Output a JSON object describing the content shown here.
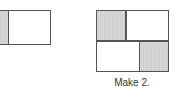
{
  "figures": [
    {
      "id": "figure-left",
      "description": "Rectangle partitioned with one shaded strip (clipped at left edge)",
      "shaded_parts": 1
    },
    {
      "id": "figure-right",
      "description": "Square split into 2 rows; top row has shaded left cell, bottom row has shaded right cell",
      "rows": 2,
      "shaded_parts": 2
    }
  ],
  "caption": "Make 2.",
  "colors": {
    "stroke": "#555555",
    "shade": "#d9d9d9",
    "background": "#ffffff"
  }
}
